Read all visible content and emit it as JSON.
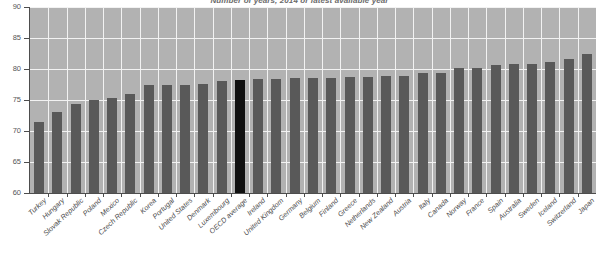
{
  "chart_data": {
    "type": "bar",
    "title": "Number of years, 2014 or latest available year",
    "xlabel": "",
    "ylabel": "",
    "ylim": [
      60,
      90
    ],
    "yticks": [
      60,
      65,
      70,
      75,
      80,
      85,
      90
    ],
    "grid": true,
    "legend": "none",
    "highlight_category": "OECD average",
    "highlight_color": "#111111",
    "bar_color": "#595959",
    "plot_background": "#b2b2b2",
    "gridline_color": "#f2f2f2",
    "categories": [
      "Turkey",
      "Hungary",
      "Slovak Republic",
      "Poland",
      "Mexico",
      "Czech Republic",
      "Korea",
      "Portugal",
      "United States",
      "Denmark",
      "Luxembourg",
      "OECD average",
      "Ireland",
      "United Kingdom",
      "Germany",
      "Belgium",
      "Finland",
      "Greece",
      "Netherlands",
      "New Zealand",
      "Austria",
      "Italy",
      "Canada",
      "Norway",
      "France",
      "Spain",
      "Australia",
      "Sweden",
      "Iceland",
      "Switzerland",
      "Japan"
    ],
    "values": [
      71.5,
      73.0,
      74.3,
      75.0,
      75.3,
      76.0,
      77.4,
      77.4,
      77.5,
      77.6,
      78.0,
      78.3,
      78.4,
      78.4,
      78.5,
      78.5,
      78.6,
      78.7,
      78.7,
      78.8,
      78.8,
      79.3,
      79.3,
      80.1,
      80.2,
      80.7,
      80.8,
      80.8,
      81.1,
      81.6,
      82.5
    ]
  },
  "axis": {
    "y_tick_labels": [
      "90",
      "85",
      "80",
      "75",
      "70",
      "65",
      "60"
    ]
  }
}
